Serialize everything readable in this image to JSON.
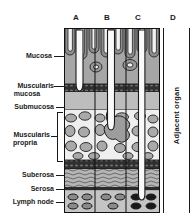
{
  "figure": {
    "type": "medical-diagram",
    "background_color": "#ffffff",
    "line_color": "#1a1a1a"
  },
  "columns": [
    {
      "key": "A",
      "label": "A",
      "x": 76,
      "description": "tumor confined to mucosa"
    },
    {
      "key": "B",
      "label": "B",
      "x": 107,
      "description": "tumor invading muscularis propria"
    },
    {
      "key": "C",
      "label": "C",
      "x": 138,
      "description": "tumor through wall with positive lymph nodes"
    },
    {
      "key": "D",
      "label": "D",
      "x": 172,
      "description": "tumor invading adjacent organ"
    }
  ],
  "layers": [
    {
      "key": "mucosa",
      "label": "Mucosa",
      "y_top": 28,
      "y_bottom": 84,
      "fill": "#a8a8a8"
    },
    {
      "key": "muscularis-mucosa",
      "label": "Muscularis\nmucosa",
      "y_top": 84,
      "y_bottom": 92,
      "fill": "#3a3a3a"
    },
    {
      "key": "submucosa",
      "label": "Submucosa",
      "y_top": 92,
      "y_bottom": 110,
      "fill": "#b8b8b8"
    },
    {
      "key": "muscularis-propria",
      "label": "Muscularis\npropria",
      "y_top": 110,
      "y_bottom": 160,
      "fill": "#e8e8e8"
    },
    {
      "key": "subserosa",
      "label": "Suberosa",
      "y_top": 166,
      "y_bottom": 184,
      "fill": "#b0b0b0"
    },
    {
      "key": "serosa",
      "label": "Serosa",
      "y_top": 184,
      "y_bottom": 188,
      "fill": "#2a2a2a"
    },
    {
      "key": "lymph-node",
      "label": "Lymph node",
      "y_top": 188,
      "y_bottom": 213,
      "fill": "#c0c0c0"
    }
  ],
  "labels": {
    "mucosa": "Mucosa",
    "muscularis_mucosa_1": "Muscularis",
    "muscularis_mucosa_2": "mucosa",
    "submucosa": "Submucosa",
    "muscularis_propria_1": "Muscularis",
    "muscularis_propria_2": "propria",
    "subserosa": "Suberosa",
    "serosa": "Serosa",
    "lymph_node": "Lymph node",
    "adjacent_organ": "Adjacent organ"
  },
  "lymph_nodes": {
    "normal_fill": "#8a8a8a",
    "metastatic_fill": "#1a1a1a",
    "note": "nodes under column C are darkly filled (involved)"
  }
}
